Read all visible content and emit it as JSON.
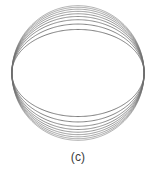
{
  "figure": {
    "caption": "(c)",
    "caption_color": "#3a3a3a",
    "background_color": "#ffffff",
    "stroke_color": "#6e6e6e",
    "width": 156,
    "height": 170,
    "plot_height": 146
  },
  "chart_data": {
    "type": "line",
    "title": "(c)",
    "subtitle": "",
    "xlabel": "",
    "ylabel": "",
    "grid": false,
    "legend": null,
    "axes_visible": false,
    "tick_labels_x": [],
    "tick_labels_y": [],
    "xlim": [
      -1.18,
      1.18
    ],
    "ylim": [
      -1.35,
      1.35
    ],
    "center": [
      0,
      0
    ],
    "n_curves": 9,
    "series": [
      {
        "name": "contour-1",
        "semi_axis_x": 1.0,
        "semi_axis_y": 0.805,
        "values": [
          0.805
        ]
      },
      {
        "name": "contour-2",
        "semi_axis_x": 1.0,
        "semi_axis_y": 0.905,
        "values": [
          0.905
        ]
      },
      {
        "name": "contour-3",
        "semi_axis_x": 1.0,
        "semi_axis_y": 0.985,
        "values": [
          0.985
        ]
      },
      {
        "name": "contour-4",
        "semi_axis_x": 1.0,
        "semi_axis_y": 1.045,
        "values": [
          1.045
        ]
      },
      {
        "name": "contour-5",
        "semi_axis_x": 1.0,
        "semi_axis_y": 1.095,
        "values": [
          1.095
        ]
      },
      {
        "name": "contour-6",
        "semi_axis_x": 1.0,
        "semi_axis_y": 1.14,
        "values": [
          1.14
        ]
      },
      {
        "name": "contour-7",
        "semi_axis_x": 1.0,
        "semi_axis_y": 1.18,
        "values": [
          1.18
        ]
      },
      {
        "name": "contour-8",
        "semi_axis_x": 1.0,
        "semi_axis_y": 1.215,
        "values": [
          1.215
        ]
      },
      {
        "name": "contour-9",
        "semi_axis_x": 1.0,
        "semi_axis_y": 1.245,
        "values": [
          1.245
        ]
      }
    ]
  }
}
